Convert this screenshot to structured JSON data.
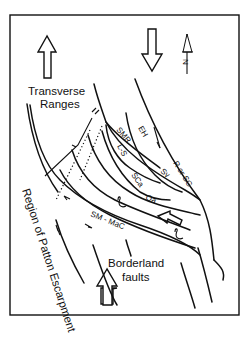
{
  "figure": {
    "type": "fault map diagram",
    "labels": {
      "transverse_ranges": [
        "Transverse",
        "Ranges"
      ],
      "region_patton": "Region of Patton Escarpment",
      "borderland": [
        "Borderland",
        "faults"
      ],
      "north": "N",
      "faults": {
        "smr": "SMR",
        "eh": "EH",
        "ls": "L-S",
        "r_or_sg": "R or SG",
        "sy": "Sy",
        "sca": "SCa",
        "oa": "Oa",
        "sm_mac": "SM - MaC"
      }
    },
    "arrows": [
      {
        "name": "compression-arrow-up-left",
        "direction": "up"
      },
      {
        "name": "compression-arrow-down-top",
        "direction": "down"
      },
      {
        "name": "compression-arrow-up-bottom",
        "direction": "up"
      },
      {
        "name": "compression-arrow-left-middle",
        "direction": "left"
      }
    ],
    "colors": {
      "ink": "#111111",
      "background": "#ffffff"
    }
  }
}
